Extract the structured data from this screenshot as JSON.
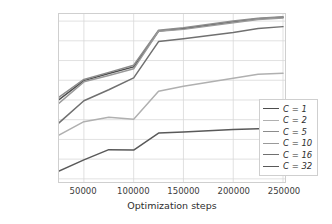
{
  "chart_data": {
    "type": "line",
    "title": "",
    "xlabel": "Optimization steps",
    "ylabel": "Avg. train ELBO",
    "xlim": [
      25000,
      252000
    ],
    "ylim": [
      -3790,
      -1660
    ],
    "xticks": [
      50000,
      100000,
      150000,
      200000,
      250000
    ],
    "xticklabels": [
      "50000",
      "100000",
      "150000",
      "200000",
      "250000"
    ],
    "yticks": [
      -1750,
      -2000,
      -2250,
      -2500,
      -2750,
      -3000,
      -3250,
      -3500,
      -3750
    ],
    "yticklabels": [
      "−1750",
      "−2000",
      "−2250",
      "−2500",
      "−2750",
      "−3000",
      "−3250",
      "−3500",
      "−3750"
    ],
    "grid": true,
    "grid_color": "#d9d9d9",
    "legend_position": "lower right",
    "x": [
      25000,
      50000,
      75000,
      100000,
      125000,
      150000,
      200000,
      225000,
      250000
    ],
    "series": [
      {
        "name": "C = 1",
        "label_prefix": "C",
        "label_value": "1",
        "color": "#4d4d4d",
        "values": [
          -2745,
          -2505,
          -2415,
          -2330,
          -1875,
          -1845,
          -1760,
          -1720,
          -1700
        ]
      },
      {
        "name": "C = 2",
        "label_prefix": "C",
        "label_value": "2",
        "color": "#b0b0b0",
        "values": [
          -3195,
          -3025,
          -2970,
          -2995,
          -2640,
          -2575,
          -2475,
          -2425,
          -2410
        ]
      },
      {
        "name": "C = 5",
        "label_prefix": "C",
        "label_value": "5",
        "color": "#8c8c8c",
        "values": [
          -2715,
          -2490,
          -2400,
          -2310,
          -1865,
          -1835,
          -1750,
          -1715,
          -1695
        ]
      },
      {
        "name": "C = 10",
        "label_prefix": "C",
        "label_value": "10",
        "color": "#9a9a9a",
        "values": [
          -2790,
          -2520,
          -2440,
          -2355,
          -1880,
          -1855,
          -1770,
          -1730,
          -1710
        ]
      },
      {
        "name": "C = 16",
        "label_prefix": "C",
        "label_value": "16",
        "color": "#707070",
        "values": [
          -3040,
          -2760,
          -2620,
          -2470,
          -2010,
          -1975,
          -1895,
          -1845,
          -1820
        ]
      },
      {
        "name": "C = 32",
        "label_prefix": "C",
        "label_value": "32",
        "color": "#595959",
        "values": [
          -3650,
          -3510,
          -3380,
          -3385,
          -3170,
          -3155,
          -3125,
          -3115,
          -3110
        ]
      }
    ]
  }
}
